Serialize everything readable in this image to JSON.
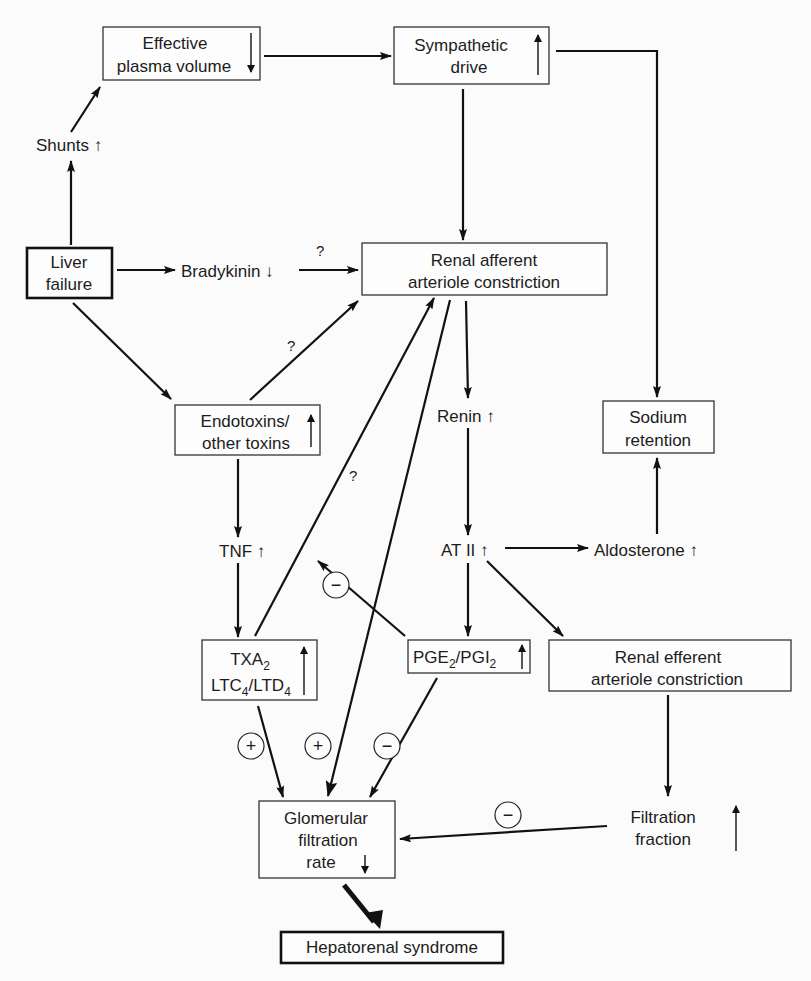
{
  "diagram": {
    "nodes": {
      "effective_plasma_volume": {
        "line1": "Effective",
        "line2": "plasma volume",
        "indicator": "down"
      },
      "sympathetic_drive": {
        "line1": "Sympathetic",
        "line2": "drive",
        "indicator": "up"
      },
      "shunts": {
        "label": "Shunts ↑"
      },
      "liver_failure": {
        "line1": "Liver",
        "line2": "failure"
      },
      "bradykinin": {
        "label": "Bradykinin ↓"
      },
      "renal_afferent": {
        "line1": "Renal afferent",
        "line2": "arteriole constriction"
      },
      "endotoxins": {
        "line1": "Endotoxins/",
        "line2": "other toxins",
        "indicator": "up"
      },
      "renin": {
        "label": "Renin ↑"
      },
      "sodium_retention": {
        "line1": "Sodium",
        "line2": "retention"
      },
      "tnf": {
        "label": "TNF ↑"
      },
      "at2": {
        "label": "AT II ↑"
      },
      "aldosterone": {
        "label": "Aldosterone ↑"
      },
      "txa2": {
        "line1_main": "TXA",
        "line1_sub": "2",
        "line2_a": "LTC",
        "line2_a_sub": "4",
        "line2_b": "/LTD",
        "line2_b_sub": "4",
        "indicator": "up"
      },
      "pge2_pgi2": {
        "a": "PGE",
        "a_sub": "2",
        "b": "/PGI",
        "b_sub": "2",
        "indicator": "up"
      },
      "renal_efferent": {
        "line1": "Renal efferent",
        "line2": "arteriole constriction"
      },
      "filtration_fraction": {
        "line1": "Filtration",
        "line2": "fraction",
        "indicator": "up"
      },
      "gfr": {
        "line1": "Glomerular",
        "line2": "filtration",
        "line3": "rate",
        "indicator": "down"
      },
      "hepatorenal": {
        "label": "Hepatorenal syndrome"
      }
    },
    "annotations": {
      "question": "?",
      "plus": "+",
      "minus": "−"
    },
    "colors": {
      "ink": "#111111",
      "background": "#fbfbfb",
      "box_fill": "#fdfdfd"
    }
  }
}
